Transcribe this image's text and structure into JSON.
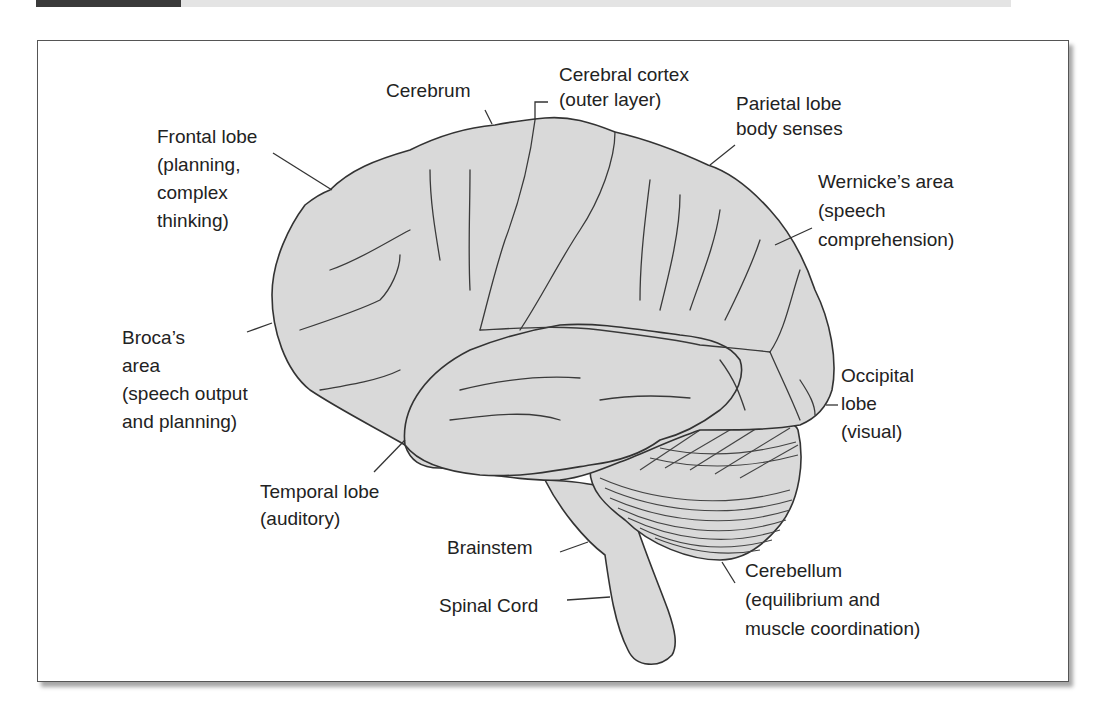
{
  "diagram": {
    "colors": {
      "brain_fill": "#d9d9d9",
      "outline": "#333333",
      "text": "#222222",
      "header_dark": "#3a3a3a",
      "header_gray": "#e4e4e4"
    },
    "labels": {
      "cerebrum": [
        "Cerebrum"
      ],
      "cerebral_cortex": [
        "Cerebral cortex",
        "(outer layer)"
      ],
      "parietal_lobe": [
        "Parietal lobe",
        "body senses"
      ],
      "frontal_lobe": [
        "Frontal lobe",
        "(planning,",
        "complex",
        "thinking)"
      ],
      "wernickes_area": [
        "Wernicke’s area",
        "(speech",
        "comprehension)"
      ],
      "brocas_area": [
        "Broca’s",
        "area",
        "(speech output",
        "and planning)"
      ],
      "occipital_lobe": [
        "Occipital",
        "lobe",
        "(visual)"
      ],
      "temporal_lobe": [
        "Temporal lobe",
        "(auditory)"
      ],
      "brainstem": [
        "Brainstem"
      ],
      "spinal_cord": [
        "Spinal Cord"
      ],
      "cerebellum": [
        "Cerebellum",
        "(equilibrium and",
        "muscle coordination)"
      ]
    }
  }
}
